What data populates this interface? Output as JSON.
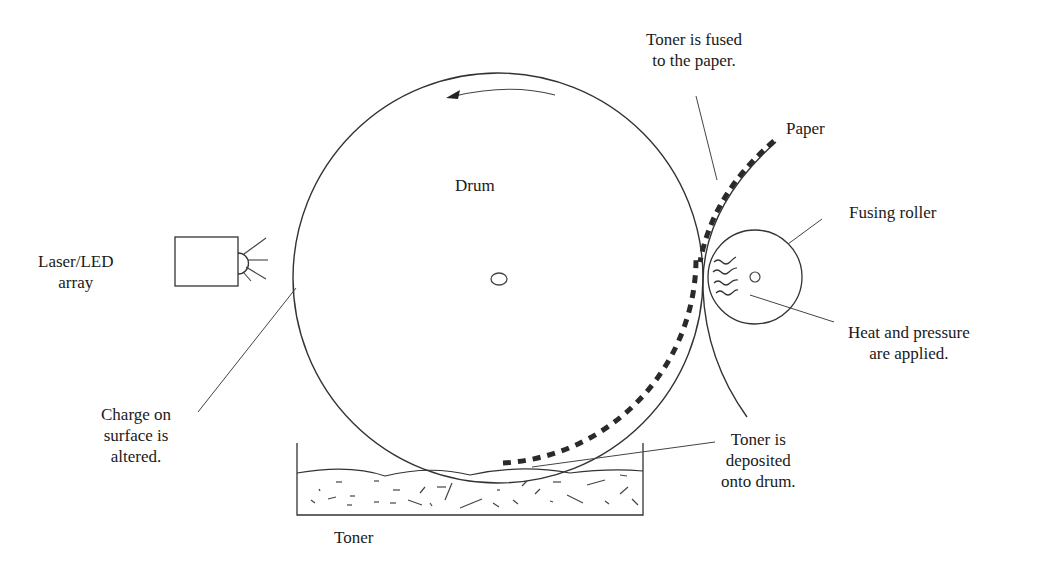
{
  "diagram": {
    "labels": {
      "drum": "Drum",
      "laser": [
        "Laser/LED",
        "array"
      ],
      "charge": [
        "Charge on",
        "surface is",
        "altered."
      ],
      "fused": [
        "Toner is fused",
        "to the paper."
      ],
      "paper": "Paper",
      "fusing_roller": "Fusing roller",
      "heat": [
        "Heat and pressure",
        "are applied."
      ],
      "deposited": [
        "Toner is",
        "deposited",
        "onto drum."
      ],
      "toner": "Toner"
    },
    "components": [
      "drum",
      "laser-led-array",
      "fusing-roller",
      "paper",
      "toner-reservoir"
    ],
    "rotation": "counter-clockwise",
    "colors": {
      "line": "#333333",
      "toner": "#2a2a2a",
      "background": "#ffffff"
    }
  }
}
